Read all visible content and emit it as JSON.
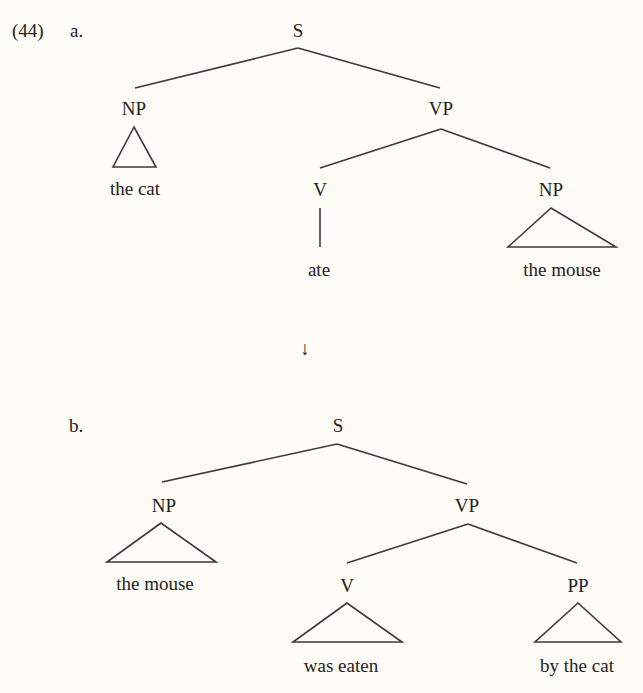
{
  "example": {
    "number": "(44)",
    "arrow": "↓",
    "trees": [
      {
        "label": "a.",
        "nodes": [
          {
            "id": "S",
            "text": "S",
            "x": 298,
            "y": 37
          },
          {
            "id": "NP",
            "text": "NP",
            "x": 134,
            "y": 115
          },
          {
            "id": "VP",
            "text": "VP",
            "x": 441,
            "y": 115
          },
          {
            "id": "V",
            "text": "V",
            "x": 320,
            "y": 196
          },
          {
            "id": "NP2",
            "text": "NP",
            "x": 551,
            "y": 196
          },
          {
            "id": "w1",
            "text": "the cat",
            "x": 135,
            "y": 195
          },
          {
            "id": "w2",
            "text": "ate",
            "x": 319,
            "y": 276
          },
          {
            "id": "w3",
            "text": "the mouse",
            "x": 562,
            "y": 276
          }
        ],
        "lines": [
          [
            298,
            48,
            135,
            88
          ],
          [
            298,
            48,
            440,
            88
          ],
          [
            441,
            129,
            320,
            168
          ],
          [
            441,
            129,
            550,
            168
          ],
          [
            320,
            208,
            320,
            247
          ]
        ],
        "triangles": [
          [
            134,
            127,
            113,
            167,
            156,
            167
          ],
          [
            551,
            208,
            508,
            247,
            616,
            247
          ]
        ]
      },
      {
        "label": "b.",
        "nodes": [
          {
            "id": "S",
            "text": "S",
            "x": 338,
            "y": 432
          },
          {
            "id": "NP",
            "text": "NP",
            "x": 164,
            "y": 512
          },
          {
            "id": "VP",
            "text": "VP",
            "x": 467,
            "y": 512
          },
          {
            "id": "V",
            "text": "V",
            "x": 347,
            "y": 592
          },
          {
            "id": "PP",
            "text": "PP",
            "x": 578,
            "y": 592
          },
          {
            "id": "w1",
            "text": "the mouse",
            "x": 155,
            "y": 590
          },
          {
            "id": "w2",
            "text": "was eaten",
            "x": 341,
            "y": 672
          },
          {
            "id": "w3",
            "text": "by the cat",
            "x": 577,
            "y": 672
          }
        ],
        "lines": [
          [
            337,
            444,
            162,
            482
          ],
          [
            337,
            444,
            467,
            484
          ],
          [
            468,
            524,
            347,
            563
          ],
          [
            468,
            524,
            577,
            563
          ]
        ],
        "triangles": [
          [
            161,
            523,
            107,
            562,
            216,
            562
          ],
          [
            347,
            603,
            293,
            642,
            402,
            642
          ],
          [
            578,
            603,
            535,
            642,
            621,
            642
          ]
        ]
      }
    ]
  }
}
